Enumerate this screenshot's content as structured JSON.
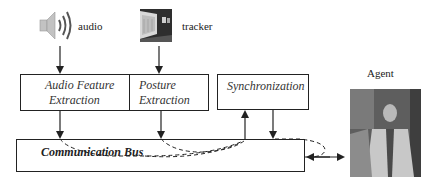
{
  "diagram": {
    "inputs": [
      {
        "id": "audio",
        "label": "audio",
        "icon": "speaker-icon"
      },
      {
        "id": "tracker",
        "label": "tracker",
        "icon": "tracker-camera-image"
      }
    ],
    "modules": [
      {
        "id": "audio-feature-extraction",
        "line1": "Audio Feature",
        "line2": "Extraction"
      },
      {
        "id": "posture-extraction",
        "line1": "Posture",
        "line2": "Extraction"
      },
      {
        "id": "synchronization",
        "line1": "Synchronization",
        "line2": ""
      }
    ],
    "bus": {
      "label": "Communication Bus"
    },
    "agent": {
      "label": "Agent",
      "icon": "agent-avatar-image"
    },
    "colors": {
      "line": "#222222",
      "box_border": "#222222",
      "agent_bg": "#6b6b6b",
      "speaker": "#b8b8b8"
    }
  }
}
